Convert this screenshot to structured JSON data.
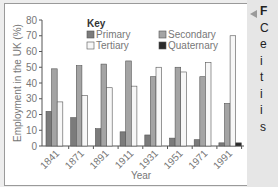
{
  "chart_data": {
    "type": "bar",
    "title": "",
    "xlabel": "Year",
    "ylabel": "Employment in the UK (%)",
    "ylim": [
      0,
      80
    ],
    "yticks": [
      0,
      10,
      20,
      30,
      40,
      50,
      60,
      70,
      80
    ],
    "categories": [
      "1841",
      "1871",
      "1891",
      "1911",
      "1931",
      "1951",
      "1971",
      "1991"
    ],
    "legend_title": "Key",
    "series": [
      {
        "name": "Primary",
        "color": "#7b7b7b",
        "values": [
          22,
          18,
          11,
          9,
          7,
          5,
          4,
          2
        ]
      },
      {
        "name": "Secondary",
        "color": "#a4a4a4",
        "values": [
          49,
          51,
          52,
          54,
          44,
          50,
          44,
          27
        ]
      },
      {
        "name": "Tertiary",
        "color": "#f7f7f7",
        "values": [
          28,
          32,
          37,
          38,
          50,
          47,
          53,
          70
        ]
      },
      {
        "name": "Quaternary",
        "color": "#2a2a2a",
        "values": [
          0,
          0,
          0,
          0,
          0,
          0,
          0,
          2
        ]
      }
    ],
    "grid": false,
    "legend_position": "top"
  },
  "sidebar": {
    "heading": "F",
    "lines": [
      "C",
      "e",
      "i",
      "t",
      "i",
      "i",
      "s"
    ]
  }
}
